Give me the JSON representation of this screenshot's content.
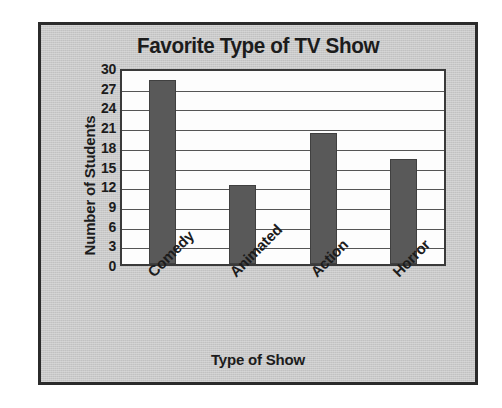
{
  "chart_data": {
    "type": "bar",
    "title": "Favorite Type of TV Show",
    "xlabel": "Type of Show",
    "ylabel": "Number of Students",
    "categories": [
      "Comedy",
      "Animated",
      "Action",
      "Horror"
    ],
    "values": [
      28,
      12,
      20,
      16
    ],
    "ylim": [
      0,
      30
    ],
    "ytick_step": 3,
    "yticks": [
      30,
      27,
      24,
      21,
      18,
      15,
      12,
      9,
      6,
      3,
      0
    ],
    "grid": true,
    "legend": "none",
    "xtick_rotation": -45,
    "colors": {
      "bar": "#595959",
      "panel_background": "#c9c9c9",
      "plot_background": "#fdfdfd",
      "border": "#2b2b2b",
      "text": "#1c1c1c",
      "gridline": "#555555"
    }
  }
}
